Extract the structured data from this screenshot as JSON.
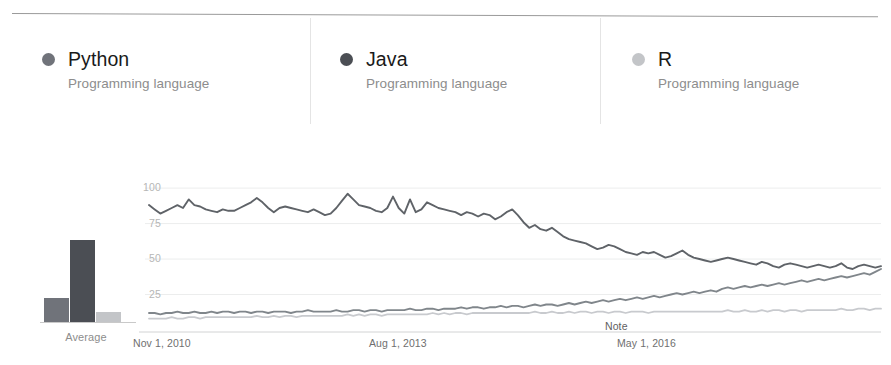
{
  "legend": {
    "items": [
      {
        "name": "Python",
        "subtitle": "Programming language",
        "color": "#70737a",
        "dot": "series-dot-icon"
      },
      {
        "name": "Java",
        "subtitle": "Programming language",
        "color": "#4b4e54",
        "dot": "series-dot-icon"
      },
      {
        "name": "R",
        "subtitle": "Programming language",
        "color": "#c3c5c8",
        "dot": "series-dot-icon"
      }
    ]
  },
  "average_chart": {
    "axis_label": "Average",
    "categories": [
      "Python",
      "Java",
      "R"
    ],
    "values": [
      22,
      75,
      9
    ]
  },
  "chart_data": {
    "type": "line",
    "title": "",
    "xlabel": "",
    "ylabel": "",
    "ylim": [
      0,
      100
    ],
    "xlim": [
      "Nov 1, 2010",
      "Sep 1, 2018"
    ],
    "grid": true,
    "legend_position": "top",
    "yticks": [
      100,
      75,
      50,
      25
    ],
    "xticks": [
      "Nov 1, 2010",
      "Aug 1, 2013",
      "May 1, 2016"
    ],
    "annotations": [
      {
        "text": "Note",
        "x": "2016-05",
        "y": 3
      }
    ],
    "series": [
      {
        "name": "Java",
        "color": "#5f6368",
        "values": [
          88,
          85,
          82,
          84,
          86,
          88,
          86,
          92,
          88,
          87,
          85,
          84,
          83,
          85,
          84,
          84,
          86,
          88,
          90,
          93,
          90,
          86,
          83,
          86,
          87,
          86,
          85,
          84,
          83,
          85,
          83,
          81,
          82,
          86,
          91,
          96,
          92,
          88,
          87,
          86,
          84,
          83,
          86,
          94,
          86,
          82,
          92,
          83,
          85,
          90,
          88,
          86,
          85,
          84,
          83,
          81,
          83,
          82,
          80,
          82,
          81,
          78,
          80,
          83,
          85,
          81,
          76,
          72,
          74,
          71,
          70,
          72,
          69,
          66,
          64,
          63,
          62,
          61,
          59,
          57,
          58,
          60,
          59,
          57,
          55,
          54,
          53,
          55,
          54,
          55,
          53,
          51,
          52,
          54,
          56,
          53,
          51,
          50,
          49,
          48,
          49,
          50,
          51,
          50,
          49,
          48,
          47,
          46,
          48,
          47,
          45,
          44,
          46,
          47,
          46,
          45,
          44,
          45,
          46,
          45,
          44,
          45,
          47,
          44,
          43,
          45,
          46,
          45,
          44,
          45
        ]
      },
      {
        "name": "Python",
        "color": "#80868b",
        "values": [
          12,
          12,
          11,
          12,
          12,
          13,
          12,
          12,
          13,
          12,
          12,
          13,
          12,
          13,
          13,
          12,
          13,
          13,
          12,
          13,
          13,
          12,
          13,
          13,
          13,
          12,
          13,
          13,
          14,
          13,
          13,
          13,
          13,
          14,
          13,
          13,
          14,
          14,
          13,
          14,
          14,
          13,
          14,
          14,
          14,
          14,
          15,
          14,
          14,
          15,
          15,
          14,
          15,
          15,
          15,
          16,
          15,
          16,
          16,
          15,
          16,
          16,
          17,
          16,
          17,
          17,
          16,
          17,
          18,
          17,
          18,
          18,
          17,
          18,
          19,
          18,
          19,
          20,
          19,
          20,
          21,
          20,
          21,
          22,
          21,
          22,
          23,
          22,
          23,
          24,
          23,
          24,
          25,
          26,
          25,
          26,
          27,
          26,
          27,
          28,
          27,
          29,
          30,
          29,
          30,
          31,
          30,
          31,
          32,
          31,
          32,
          33,
          32,
          33,
          34,
          35,
          34,
          35,
          36,
          35,
          36,
          37,
          38,
          37,
          38,
          39,
          40,
          39,
          41,
          43
        ]
      },
      {
        "name": "R",
        "color": "#c8cace",
        "values": [
          8,
          8,
          8,
          8,
          9,
          8,
          8,
          9,
          9,
          8,
          9,
          9,
          9,
          9,
          9,
          9,
          9,
          9,
          9,
          10,
          9,
          9,
          10,
          9,
          10,
          10,
          9,
          10,
          10,
          10,
          10,
          10,
          10,
          10,
          10,
          11,
          10,
          11,
          10,
          11,
          11,
          10,
          11,
          11,
          11,
          11,
          11,
          11,
          11,
          11,
          12,
          11,
          12,
          11,
          12,
          12,
          11,
          12,
          12,
          12,
          12,
          12,
          12,
          12,
          12,
          12,
          12,
          12,
          13,
          12,
          12,
          13,
          12,
          12,
          13,
          12,
          13,
          13,
          12,
          13,
          13,
          12,
          13,
          13,
          12,
          13,
          13,
          13,
          12,
          13,
          13,
          13,
          13,
          13,
          13,
          13,
          13,
          13,
          13,
          13,
          13,
          13,
          14,
          13,
          13,
          14,
          13,
          13,
          14,
          13,
          14,
          14,
          13,
          14,
          14,
          13,
          14,
          14,
          14,
          14,
          14,
          14,
          15,
          14,
          14,
          15,
          15,
          14,
          15,
          15
        ]
      }
    ]
  }
}
